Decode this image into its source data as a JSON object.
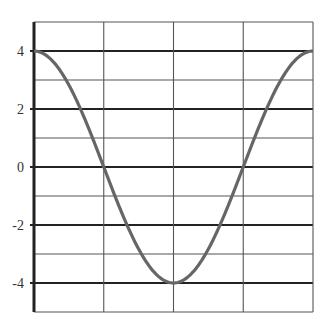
{
  "chart_data": {
    "type": "line",
    "title": "",
    "xlabel": "",
    "ylabel": "",
    "ylim": [
      -5,
      5
    ],
    "xlim": [
      0,
      4
    ],
    "y_tick_labels": [
      "4",
      "2",
      "0",
      "-2",
      "-4"
    ],
    "y_ticks": [
      4,
      2,
      0,
      -2,
      -4
    ],
    "x_tick_labels": [],
    "grid": true,
    "legend": [],
    "series": [
      {
        "name": "4cos(x)",
        "color": "#666666",
        "x": [
          0,
          0.5,
          1,
          1.5,
          2,
          2.5,
          3,
          3.5,
          4
        ],
        "values": [
          4,
          2.83,
          0,
          -2.83,
          -4,
          -2.83,
          0,
          2.83,
          4
        ]
      }
    ]
  },
  "colors": {
    "grid_major": "#222222",
    "grid_minor": "#555555",
    "curve": "#666666"
  }
}
